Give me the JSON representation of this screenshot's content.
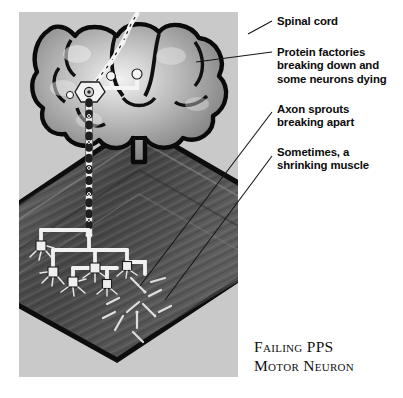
{
  "figure": {
    "title_line1": "Failing PPS",
    "title_line2": "Motor Neuron",
    "panel_background": "#c9c9c9",
    "ink_color": "#0b0b0b"
  },
  "labels": [
    {
      "id": "spinal-cord",
      "text": "Spinal cord"
    },
    {
      "id": "protein-factories",
      "text": "Protein factories\nbreaking down and\nsome neurons dying"
    },
    {
      "id": "axon-sprouts",
      "text": "Axon sprouts\nbreaking apart"
    },
    {
      "id": "shrinking-muscle",
      "text": "Sometimes, a\nshrinking muscle"
    }
  ],
  "illustration": {
    "parts": [
      "spinal-cord-cross-section",
      "motor-neuron-cell-body",
      "dendrites",
      "myelinated-axon",
      "axon-terminal-branches",
      "motor-endplates",
      "broken-axon-sprouts",
      "muscle-fiber-band"
    ]
  }
}
